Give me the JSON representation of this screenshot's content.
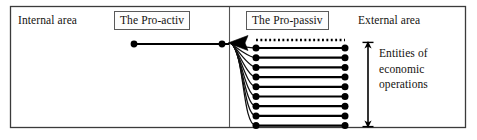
{
  "figure": {
    "kind": "block-diagram",
    "title_text": "",
    "frame": {
      "stroke": "#3b3b3b",
      "fill": "#ffffff"
    }
  },
  "labels": {
    "internal_area": "Internal area",
    "pro_activ": "The Pro-activ",
    "pro_passiv": "The Pro-passiv",
    "external_area": "External area",
    "entities_line1": "Entities of",
    "entities_line2": "economic",
    "entities_line3": "operations"
  },
  "colors": {
    "ink": "#14120f",
    "frame_stroke": "#3b3b3b",
    "divider_stroke": "#555555",
    "box_stroke": "#5a5a5a",
    "line_stroke": "#000000",
    "curve_stroke": "#111111",
    "background": "#ffffff"
  },
  "geometry": {
    "canvas_width": 477,
    "canvas_height": 140,
    "frame": {
      "x": 10,
      "y": 6,
      "width": 456,
      "height": 122
    },
    "divider_x": 229,
    "proactiv_line": {
      "x1": 133,
      "x2": 228,
      "y": 44
    },
    "arrowhead": {
      "tip_x": 230,
      "y": 43
    },
    "dotted_line": {
      "x1": 256,
      "x2": 345,
      "y": 40
    },
    "entity_lines": {
      "x1": 256,
      "x2": 345,
      "y_start": 48,
      "y_step": 9.7,
      "count": 9
    },
    "span_arrow": {
      "x": 368,
      "y_top": 42,
      "y_bottom": 127
    }
  },
  "entity_rows": [
    {
      "index": 1,
      "y": 48.0
    },
    {
      "index": 2,
      "y": 57.7
    },
    {
      "index": 3,
      "y": 67.4
    },
    {
      "index": 4,
      "y": 77.1
    },
    {
      "index": 5,
      "y": 86.8
    },
    {
      "index": 6,
      "y": 96.5
    },
    {
      "index": 7,
      "y": 106.2
    },
    {
      "index": 8,
      "y": 115.9
    },
    {
      "index": 9,
      "y": 125.6
    }
  ],
  "icons": {
    "left_arrowhead": "arrow-left-icon",
    "span_double_arrow": "double-arrow-vertical-icon",
    "dotted_connector": "dotted-line-icon"
  }
}
